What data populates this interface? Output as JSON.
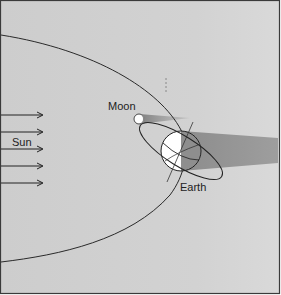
{
  "diagram": {
    "labels": {
      "moon": "Moon",
      "sun": "Sun",
      "earth": "Earth"
    },
    "colors": {
      "background": "#cfcfcf",
      "background_right": "#d6d6d6",
      "border": "#3a3a3a",
      "orbit_line": "#2a2a2a",
      "shadow": "#9a9a9a",
      "earth_dark": "#8e8e8e",
      "earth_light": "#ffffff",
      "moon_shadow": "#8a8a8a"
    },
    "sun_arrows": 5
  }
}
